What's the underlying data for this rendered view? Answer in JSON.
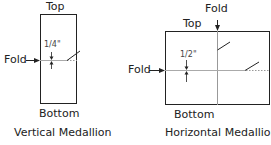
{
  "vertical": {
    "top_label": "Top",
    "bottom_label": "Bottom",
    "fold_label": "Fold",
    "measure_label": "1/4\"",
    "caption": "Vertical Medallion"
  },
  "horizontal": {
    "top_label": "Top",
    "bottom_label": "Bottom",
    "fold_label_left": "Fold",
    "fold_label_top": "Fold",
    "measure_label": "1/2\"",
    "caption": "Horizontal Medallion"
  },
  "colors": {
    "outline": "#222222",
    "fold_line": "#999999"
  }
}
